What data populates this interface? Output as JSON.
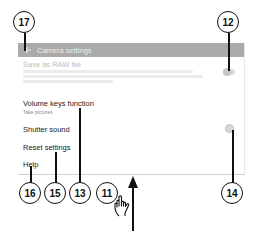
{
  "header": {
    "back_icon": "arrow-left-icon",
    "title": "Camera settings"
  },
  "settings": {
    "items": [
      {
        "title": "Save as RAW file",
        "subtitle": "",
        "state": "disabled",
        "control": "toggle"
      },
      {
        "title": "Volume keys function",
        "subtitle": "Take pictures",
        "state": "enabled",
        "control": "none"
      },
      {
        "title": "Shutter sound",
        "subtitle": "",
        "state": "enabled",
        "control": "toggle"
      },
      {
        "title": "Reset settings",
        "subtitle": "",
        "state": "enabled",
        "control": "none"
      },
      {
        "title": "Help",
        "subtitle": "",
        "state": "enabled",
        "control": "none"
      }
    ]
  },
  "callouts": [
    {
      "number": "17",
      "target": "back-button"
    },
    {
      "number": "12",
      "target": "save-raw-toggle"
    },
    {
      "number": "16",
      "target": "help"
    },
    {
      "number": "15",
      "target": "reset-settings"
    },
    {
      "number": "13",
      "target": "volume-keys-function"
    },
    {
      "number": "11",
      "target": "swipe-up-gesture"
    },
    {
      "number": "14",
      "target": "shutter-sound-toggle"
    }
  ],
  "gesture": {
    "icon": "hand-pointer-icon",
    "direction": "up"
  },
  "colors": {
    "header_bg": "#aaaaaa",
    "header_text": "#eeeeee",
    "text": "#222222",
    "disabled_text": "#bcbcbc",
    "callout_stroke": "#111111"
  }
}
